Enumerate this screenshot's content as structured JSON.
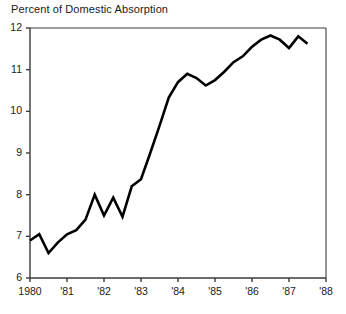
{
  "chart_data": {
    "type": "line",
    "title": "Percent of Domestic Absorption",
    "xlabel": "",
    "ylabel": "",
    "grid": false,
    "legend": "none",
    "xlim": [
      1980,
      1988
    ],
    "ylim": [
      6,
      12
    ],
    "y_ticks": [
      12,
      11,
      10,
      9,
      8,
      7,
      6
    ],
    "y_tick_labels": [
      "12",
      "11",
      "10",
      "9",
      "8",
      "7",
      "6"
    ],
    "x_ticks": [
      1980,
      1981,
      1982,
      1983,
      1984,
      1985,
      1986,
      1987,
      1988
    ],
    "x_tick_labels": [
      "1980",
      "'81",
      "'82",
      "'83",
      "'84",
      "'85",
      "'86",
      "'87",
      "'88"
    ],
    "line_color": "#000000",
    "line_width": 2.6,
    "axis_color": "#3a3a3a",
    "background": "#ffffff",
    "series": [
      {
        "name": "Percent of Domestic Absorption",
        "x": [
          1980.0,
          1980.25,
          1980.5,
          1980.75,
          1981.0,
          1981.25,
          1981.5,
          1981.75,
          1982.0,
          1982.25,
          1982.5,
          1982.75,
          1983.0,
          1983.25,
          1983.5,
          1983.75,
          1984.0,
          1984.25,
          1984.5,
          1984.75,
          1985.0,
          1985.25,
          1985.5,
          1985.75,
          1986.0,
          1986.25,
          1986.5,
          1986.75,
          1987.0,
          1987.25,
          1987.5
        ],
        "values": [
          6.9,
          7.05,
          6.6,
          6.85,
          7.05,
          7.15,
          7.4,
          8.0,
          7.5,
          7.93,
          7.47,
          8.2,
          8.37,
          9.0,
          9.65,
          10.33,
          10.7,
          10.9,
          10.8,
          10.62,
          10.75,
          10.95,
          11.18,
          11.32,
          11.55,
          11.72,
          11.82,
          11.72,
          11.52,
          11.8,
          11.62
        ]
      }
    ]
  }
}
